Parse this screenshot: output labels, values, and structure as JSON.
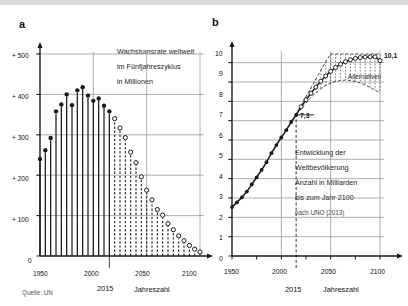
{
  "figure": {
    "background_color": "#ffffff",
    "ink_color": "#1a1a1a",
    "grid_color": "#8c8c8c",
    "panels": [
      {
        "id": "a",
        "letter": "a"
      },
      {
        "id": "b",
        "letter": "b"
      }
    ]
  },
  "panel_a": {
    "letter": "a",
    "caption_lines": [
      "Wachstumsrate weltweit",
      "im Fünfjahreszyklus",
      "in Millionen"
    ],
    "source_note": "Quelle: UN",
    "axis_x_title": "Jahreszahl",
    "marker_year_label": "2015",
    "y_ticks": [
      "0",
      "+ 100",
      "+ 200",
      "+ 300",
      "+ 400",
      "+ 500"
    ],
    "x_ticks": [
      "1950",
      "2000",
      "2050",
      "2100"
    ]
  },
  "panel_b": {
    "letter": "b",
    "caption_lines": [
      "Entwicklung der",
      "Weltbevölkerung",
      "Anzahl in Milliarden",
      "bis zum Jahr 2100"
    ],
    "source_note": "nach UNO (2013)",
    "axis_x_title": "Jahreszahl",
    "marker_year_label": "2015",
    "marker_value_label": "7,3",
    "endpoint_label": "10,1",
    "band_label": "Alternativen",
    "y_ticks": [
      "0",
      "1",
      "2",
      "3",
      "4",
      "5",
      "6",
      "7",
      "8",
      "9",
      "10"
    ],
    "x_ticks": [
      "1950",
      "2000",
      "2050",
      "2100"
    ]
  },
  "chart_data": [
    {
      "type": "bar",
      "id": "panel-a",
      "title": "Wachstumsrate weltweit im Fünfjahreszyklus in Millionen",
      "xlabel": "Jahreszahl",
      "ylabel": "Millionen",
      "xlim": [
        1950,
        2100
      ],
      "ylim": [
        0,
        500
      ],
      "grid": true,
      "legend": null,
      "annotations": [
        "2015",
        "Quelle: UN"
      ],
      "note": "Solid markers = observed (1950-2015); open markers / dashed stems = projected (2020-2100)",
      "categories": [
        1950,
        1955,
        1960,
        1965,
        1970,
        1975,
        1980,
        1985,
        1990,
        1995,
        2000,
        2005,
        2010,
        2015,
        2020,
        2025,
        2030,
        2035,
        2040,
        2045,
        2050,
        2055,
        2060,
        2065,
        2070,
        2075,
        2080,
        2085,
        2090,
        2095,
        2100
      ],
      "values": [
        240,
        262,
        292,
        358,
        375,
        400,
        373,
        410,
        418,
        397,
        384,
        390,
        372,
        358,
        340,
        317,
        293,
        257,
        231,
        196,
        163,
        139,
        115,
        101,
        80,
        65,
        50,
        38,
        26,
        17,
        10
      ],
      "series": [
        {
          "name": "beobachtet",
          "style": "solid",
          "x": [
            1950,
            1955,
            1960,
            1965,
            1970,
            1975,
            1980,
            1985,
            1990,
            1995,
            2000,
            2005,
            2010,
            2015
          ],
          "values": [
            240,
            262,
            292,
            358,
            375,
            400,
            373,
            410,
            418,
            397,
            384,
            390,
            372,
            358
          ]
        },
        {
          "name": "Prognose",
          "style": "dashed",
          "x": [
            2020,
            2025,
            2030,
            2035,
            2040,
            2045,
            2050,
            2055,
            2060,
            2065,
            2070,
            2075,
            2080,
            2085,
            2090,
            2095,
            2100
          ],
          "values": [
            340,
            317,
            293,
            257,
            231,
            196,
            163,
            139,
            115,
            101,
            80,
            65,
            50,
            38,
            26,
            17,
            10
          ]
        }
      ]
    },
    {
      "type": "line",
      "id": "panel-b",
      "title": "Entwicklung der Weltbevölkerung Anzahl in Milliarden bis zum Jahr 2100",
      "subtitle": "nach UNO (2013)",
      "xlabel": "Jahreszahl",
      "ylabel": "Milliarden",
      "xlim": [
        1950,
        2100
      ],
      "ylim": [
        0,
        10.5
      ],
      "grid": true,
      "legend": "Alternativen",
      "annotations": [
        "7,3",
        "10,1",
        "2015",
        "Alternativen"
      ],
      "x": [
        1950,
        1955,
        1960,
        1965,
        1970,
        1975,
        1980,
        1985,
        1990,
        1995,
        2000,
        2005,
        2010,
        2015,
        2020,
        2025,
        2030,
        2035,
        2040,
        2045,
        2050,
        2055,
        2060,
        2065,
        2070,
        2075,
        2080,
        2085,
        2090,
        2095,
        2100
      ],
      "series": [
        {
          "name": "Mittlere Variante",
          "style": "solid-to-open",
          "values": [
            2.53,
            2.77,
            3.03,
            3.33,
            3.7,
            4.07,
            4.45,
            4.85,
            5.32,
            5.74,
            6.13,
            6.51,
            6.93,
            7.3,
            7.72,
            8.08,
            8.42,
            8.74,
            9.04,
            9.31,
            9.55,
            9.75,
            9.92,
            10.05,
            10.15,
            10.22,
            10.26,
            10.29,
            10.3,
            10.3,
            10.1
          ]
        },
        {
          "name": "Obere Alternative",
          "style": "dashed-band",
          "values": [
            null,
            null,
            null,
            null,
            null,
            null,
            null,
            null,
            null,
            null,
            null,
            null,
            null,
            7.3,
            7.8,
            8.25,
            8.7,
            9.15,
            9.6,
            10.05,
            10.5,
            10.95,
            11.4,
            11.8,
            12.2,
            12.5,
            12.8,
            13.0,
            13.2,
            13.3,
            13.4
          ]
        },
        {
          "name": "Untere Alternative",
          "style": "dashed-band",
          "values": [
            null,
            null,
            null,
            null,
            null,
            null,
            null,
            null,
            null,
            null,
            null,
            null,
            null,
            7.3,
            7.62,
            7.92,
            8.2,
            8.45,
            8.65,
            8.82,
            8.95,
            9.03,
            9.08,
            9.1,
            9.08,
            9.03,
            8.95,
            8.85,
            8.72,
            8.58,
            8.45
          ]
        }
      ]
    }
  ]
}
